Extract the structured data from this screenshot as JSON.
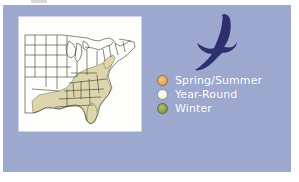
{
  "figure": {
    "kind": "range-map-figure",
    "background_color": "#ffffff",
    "panel_color": "#9ca8ce",
    "artifact": {
      "name": "scan-smudge",
      "color": "#b9bcc4"
    }
  },
  "map": {
    "name": "united-states-range-map",
    "card_background": "#fdfdfb",
    "outline_color": "#3a3a33",
    "range_fill_color": "#ddd6ac",
    "range_outline_color": "#6f6a46",
    "description": "Eastern United States map with shaded range over the Southeast"
  },
  "bird": {
    "name": "eagle-silhouette",
    "color": "#2e2f6e",
    "description": "Soaring bird of prey silhouette, wings spread"
  },
  "legend": {
    "title": "",
    "items": [
      {
        "label": "Spring/Summer",
        "color": "#e9a65c",
        "inner_color": "#f0c27a",
        "border_color": "#a8672c"
      },
      {
        "label": "Year-Round",
        "color": "#f6f4e2",
        "inner_color": "#fbfaf0",
        "border_color": "#9a9678"
      },
      {
        "label": "Winter",
        "color": "#8aa04a",
        "inner_color": "#9cb159",
        "border_color": "#5c6d2c"
      }
    ],
    "text_color": "#ffffff"
  }
}
